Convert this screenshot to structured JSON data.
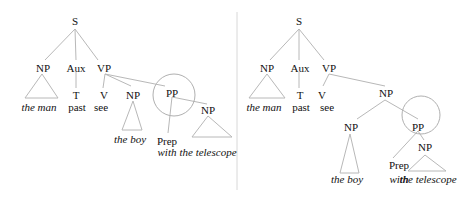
{
  "figure": {
    "left_tree": {
      "nodes": {
        "s": "S",
        "np": "NP",
        "aux": "Aux",
        "vp": "VP",
        "t": "T",
        "v": "V",
        "np_obj": "NP",
        "pp": "PP",
        "np_pp": "NP",
        "prep": "Prep"
      },
      "words": {
        "the_man": "the man",
        "past": "past",
        "see": "see",
        "the_boy": "the boy",
        "with": "with",
        "the_telescope": "the telescope"
      }
    },
    "right_tree": {
      "nodes": {
        "s": "S",
        "np": "NP",
        "aux": "Aux",
        "vp": "VP",
        "t": "T",
        "v": "V",
        "np_obj": "NP",
        "np_inner": "NP",
        "pp": "PP",
        "np_pp": "NP",
        "prep": "Prep"
      },
      "words": {
        "the_man": "the man",
        "past": "past",
        "see": "see",
        "the_boy": "the boy",
        "with": "with",
        "the_telescope": "the telescope"
      }
    }
  }
}
